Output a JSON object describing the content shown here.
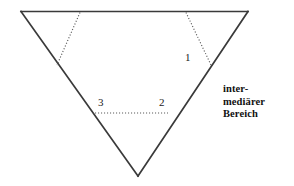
{
  "diagram": {
    "type": "inverted-triangle-schematic",
    "stroke_color": "#333333",
    "dotted_color": "#555555",
    "background_color": "#ffffff",
    "triangle": {
      "top_left": [
        21,
        11
      ],
      "top_right": [
        248,
        11
      ],
      "bottom_apex": [
        138,
        176
      ]
    },
    "dotted_segments": [
      {
        "name": "left-diagonal-dotted",
        "from": [
          80,
          12
        ],
        "to": [
          57,
          65
        ]
      },
      {
        "name": "right-diagonal-dotted",
        "from": [
          186,
          12
        ],
        "to": [
          211,
          65
        ]
      },
      {
        "name": "horizontal-dotted",
        "from": [
          95,
          113
        ],
        "to": [
          168,
          113
        ]
      }
    ],
    "labels": [
      {
        "id": "1",
        "text": "1"
      },
      {
        "id": "2",
        "text": "2"
      },
      {
        "id": "3",
        "text": "3"
      }
    ],
    "caption": {
      "lines": [
        "inter-",
        "mediärer",
        "Bereich"
      ],
      "full_text": "intermediärer Bereich"
    }
  }
}
